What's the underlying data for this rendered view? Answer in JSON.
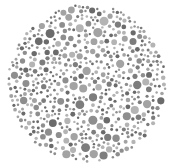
{
  "image": {
    "subject": "dot-pattern color vision test plate (grayscale)",
    "background_color": "#ffffff",
    "plate": {
      "center_x": 87,
      "center_y": 83,
      "radius": 80
    },
    "dot_colors": [
      "#6b6b6b",
      "#7d7d7d",
      "#8e8e8e",
      "#a3a3a3",
      "#b4b4b4"
    ],
    "dot_radius_range": [
      1.2,
      4.6
    ]
  }
}
